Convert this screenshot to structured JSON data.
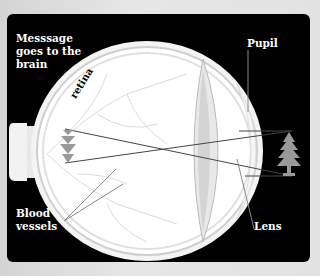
{
  "diagram": {
    "labels": {
      "message": "Messsage\ngoes to the\nbrain",
      "retina": "retina",
      "pupil": "Pupil",
      "blood_vessels": "Blood\nvessels",
      "lens": "Lens"
    },
    "objects": {
      "tree": "tree-icon",
      "inverted_image": "inverted-tree-image"
    },
    "colors": {
      "background": "#e2e2e2",
      "panel": "#000000",
      "eyeball": "#ffffff",
      "tree": "#999999",
      "lines": "#555555"
    }
  }
}
